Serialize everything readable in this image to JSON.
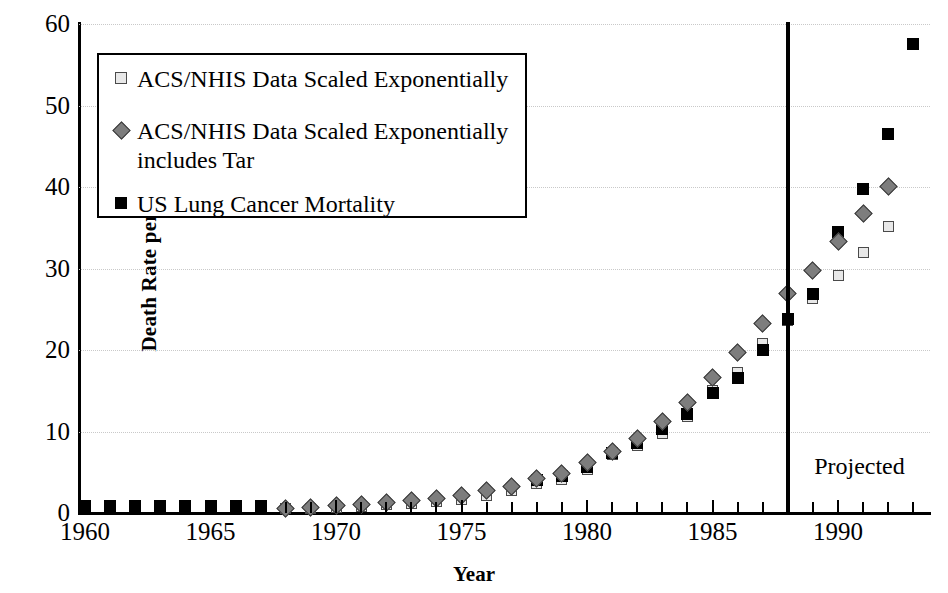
{
  "chart_data": {
    "type": "scatter",
    "title": "",
    "xlabel": "Year",
    "ylabel": "Death Rate per 100,000",
    "xlim": [
      1959.4,
      1993.8
    ],
    "ylim": [
      0,
      60
    ],
    "ytick_labels": [
      "0",
      "10",
      "20",
      "30",
      "40",
      "50",
      "60"
    ],
    "ytick_values": [
      0,
      10,
      20,
      30,
      40,
      50,
      60
    ],
    "xtick_labels": [
      "1960",
      "1965",
      "1970",
      "1975",
      "1980",
      "1985",
      "1990"
    ],
    "xtick_values": [
      1960,
      1965,
      1970,
      1975,
      1980,
      1985,
      1990
    ],
    "grid": "horizontal-dotted",
    "legend_position": "upper-left-inside",
    "annotations": [
      {
        "text": "Projected",
        "x": 1989.2,
        "y": 5.5
      },
      {
        "type": "vline",
        "x": 1988,
        "label": "projection-divider"
      }
    ],
    "x": [
      1960,
      1961,
      1962,
      1963,
      1964,
      1965,
      1966,
      1967,
      1968,
      1969,
      1970,
      1971,
      1972,
      1973,
      1974,
      1975,
      1976,
      1977,
      1978,
      1979,
      1980,
      1981,
      1982,
      1983,
      1984,
      1985,
      1986,
      1987,
      1988,
      1989,
      1990,
      1991,
      1992,
      1993
    ],
    "series": [
      {
        "name": "ACS/NHIS Data Scaled Exponentially",
        "marker": "open-square",
        "color": "#e8e8e8",
        "values": [
          null,
          null,
          null,
          null,
          null,
          null,
          null,
          null,
          0.5,
          0.6,
          0.7,
          0.8,
          1.0,
          1.2,
          1.4,
          1.7,
          2.2,
          2.8,
          3.6,
          4.1,
          5.3,
          7.2,
          8.3,
          9.7,
          11.9,
          15.0,
          17.3,
          20.8,
          23.6,
          26.3,
          29.1,
          32.0,
          35.1,
          null
        ]
      },
      {
        "name": "ACS/NHIS Data Scaled Exponentially includes Tar",
        "marker": "diamond",
        "color": "#7d7d7d",
        "values": [
          null,
          null,
          null,
          null,
          null,
          null,
          null,
          null,
          0.6,
          0.7,
          0.9,
          1.0,
          1.3,
          1.5,
          1.8,
          2.2,
          2.7,
          3.3,
          4.2,
          4.9,
          6.2,
          7.6,
          9.2,
          11.2,
          13.5,
          16.6,
          19.7,
          23.2,
          26.9,
          29.8,
          33.3,
          36.8,
          40.1,
          null
        ]
      },
      {
        "name": "US Lung Cancer Mortality",
        "marker": "solid-square",
        "color": "#000000",
        "values": [
          0.8,
          0.8,
          0.8,
          0.8,
          0.8,
          0.8,
          0.8,
          0.8,
          null,
          null,
          null,
          null,
          null,
          null,
          null,
          null,
          null,
          null,
          4.0,
          4.6,
          5.7,
          7.4,
          8.6,
          10.3,
          12.2,
          14.7,
          16.6,
          20.0,
          23.8,
          26.9,
          34.5,
          39.7,
          46.5,
          57.5
        ]
      }
    ]
  },
  "legend": {
    "items": [
      {
        "label": "ACS/NHIS Data Scaled Exponentially",
        "marker": "open-square"
      },
      {
        "label": "ACS/NHIS Data Scaled Exponentially\nincludes Tar",
        "marker": "diamond"
      },
      {
        "label": "US Lung Cancer Mortality",
        "marker": "solid-square"
      }
    ]
  },
  "axes": {
    "y_title": "Death Rate per 100,000",
    "x_title": "Year"
  },
  "projection": {
    "note": "Projected"
  }
}
